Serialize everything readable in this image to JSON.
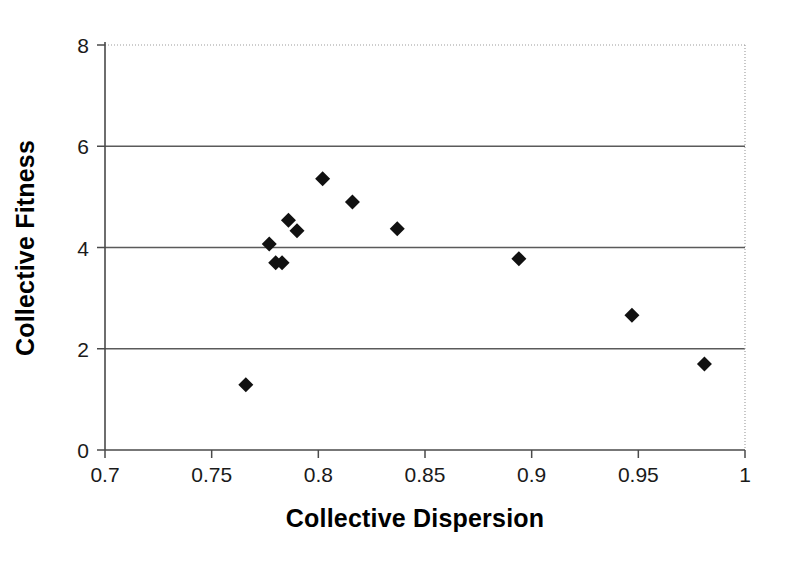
{
  "chart_data": {
    "type": "scatter",
    "title": "",
    "xlabel": "Collective Dispersion",
    "ylabel": "Collective Fitness",
    "xlim": [
      0.7,
      1.0
    ],
    "ylim": [
      0,
      8
    ],
    "xticks": [
      0.7,
      0.75,
      0.8,
      0.85,
      0.9,
      0.95,
      1
    ],
    "xtick_labels": [
      "0.7",
      "0.75",
      "0.8",
      "0.85",
      "0.9",
      "0.95",
      "1"
    ],
    "yticks": [
      0,
      2,
      4,
      6,
      8
    ],
    "ytick_labels": [
      "0",
      "2",
      "4",
      "6",
      "8"
    ],
    "grid": "horizontal",
    "legend": "none",
    "marker": "diamond",
    "marker_color": "#111111",
    "points": [
      {
        "x": 0.766,
        "y": 1.29
      },
      {
        "x": 0.777,
        "y": 4.07
      },
      {
        "x": 0.78,
        "y": 3.7
      },
      {
        "x": 0.783,
        "y": 3.7
      },
      {
        "x": 0.786,
        "y": 4.54
      },
      {
        "x": 0.79,
        "y": 4.33
      },
      {
        "x": 0.802,
        "y": 5.36
      },
      {
        "x": 0.816,
        "y": 4.9
      },
      {
        "x": 0.837,
        "y": 4.37
      },
      {
        "x": 0.894,
        "y": 3.78
      },
      {
        "x": 0.947,
        "y": 2.66
      },
      {
        "x": 0.981,
        "y": 1.7
      }
    ]
  },
  "axis": {
    "x_title": "Collective Dispersion",
    "y_title": "Collective Fitness"
  }
}
